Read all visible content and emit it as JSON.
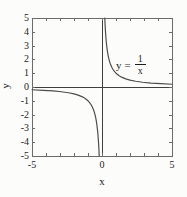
{
  "figure": {
    "background": "#fcfcfa"
  },
  "chart_data": {
    "type": "line",
    "title": "",
    "xlabel": "x",
    "ylabel": "y",
    "xlim": [
      -5,
      5
    ],
    "ylim": [
      -5,
      5
    ],
    "tick_interval": 1,
    "tick_sides": [
      "top",
      "bottom",
      "left",
      "right"
    ],
    "x_labeled_ticks": [
      {
        "v": -5,
        "label": "-5"
      },
      {
        "v": 0,
        "label": "0"
      },
      {
        "v": 5,
        "label": "5"
      }
    ],
    "y_labeled_ticks": [
      {
        "v": 5,
        "label": "5"
      },
      {
        "v": 4,
        "label": "4"
      },
      {
        "v": 3,
        "label": "3"
      },
      {
        "v": 2,
        "label": "2"
      },
      {
        "v": 1,
        "label": "1"
      },
      {
        "v": 0,
        "label": "0"
      },
      {
        "v": -1,
        "label": "-1"
      },
      {
        "v": -2,
        "label": "-2"
      },
      {
        "v": -3,
        "label": "-3"
      },
      {
        "v": -4,
        "label": "-4"
      },
      {
        "v": -5,
        "label": "-5"
      }
    ],
    "axes_through_origin": true,
    "grid": false,
    "legend": "none",
    "annotation": {
      "text": "y = 1/x",
      "lhs": "y",
      "equals": "=",
      "numerator": "1",
      "denominator": "x"
    },
    "series": [
      {
        "name": "positive-branch",
        "points": [
          [
            0.2,
            5
          ],
          [
            0.21,
            4.762
          ],
          [
            0.22,
            4.545
          ],
          [
            0.24,
            4.167
          ],
          [
            0.26,
            3.846
          ],
          [
            0.28,
            3.571
          ],
          [
            0.3,
            3.333
          ],
          [
            0.33,
            3.03
          ],
          [
            0.36,
            2.778
          ],
          [
            0.4,
            2.5
          ],
          [
            0.45,
            2.222
          ],
          [
            0.5,
            2
          ],
          [
            0.55,
            1.818
          ],
          [
            0.6,
            1.667
          ],
          [
            0.7,
            1.429
          ],
          [
            0.8,
            1.25
          ],
          [
            0.9,
            1.111
          ],
          [
            1,
            1
          ],
          [
            1.2,
            0.833
          ],
          [
            1.4,
            0.714
          ],
          [
            1.7,
            0.588
          ],
          [
            2,
            0.5
          ],
          [
            2.4,
            0.417
          ],
          [
            2.9,
            0.345
          ],
          [
            3.5,
            0.286
          ],
          [
            4.2,
            0.238
          ],
          [
            5,
            0.2
          ]
        ]
      },
      {
        "name": "negative-branch",
        "points": [
          [
            -5,
            -0.2
          ],
          [
            -4.2,
            -0.238
          ],
          [
            -3.5,
            -0.286
          ],
          [
            -2.9,
            -0.345
          ],
          [
            -2.4,
            -0.417
          ],
          [
            -2,
            -0.5
          ],
          [
            -1.7,
            -0.588
          ],
          [
            -1.4,
            -0.714
          ],
          [
            -1.2,
            -0.833
          ],
          [
            -1,
            -1
          ],
          [
            -0.9,
            -1.111
          ],
          [
            -0.8,
            -1.25
          ],
          [
            -0.7,
            -1.429
          ],
          [
            -0.6,
            -1.667
          ],
          [
            -0.55,
            -1.818
          ],
          [
            -0.5,
            -2
          ],
          [
            -0.45,
            -2.222
          ],
          [
            -0.4,
            -2.5
          ],
          [
            -0.36,
            -2.778
          ],
          [
            -0.33,
            -3.03
          ],
          [
            -0.3,
            -3.333
          ],
          [
            -0.28,
            -3.571
          ],
          [
            -0.26,
            -3.846
          ],
          [
            -0.24,
            -4.167
          ],
          [
            -0.22,
            -4.545
          ],
          [
            -0.21,
            -4.762
          ],
          [
            -0.2,
            -5
          ]
        ]
      }
    ],
    "colors": {
      "curve": "#4d4d4d",
      "axis": "#3f3f3f",
      "frame": "#6b6b6b",
      "text": "#1c1c1c",
      "background": "#fcfcfa"
    }
  }
}
